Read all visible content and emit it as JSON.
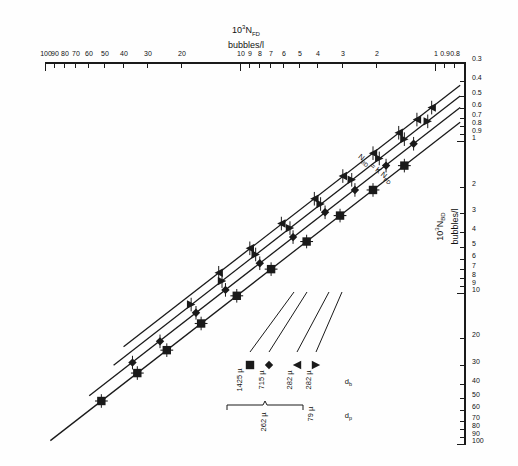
{
  "chart_data": {
    "type": "scatter",
    "title": "",
    "orientation_note": "printed upside-down (rotated 180 degrees)",
    "xlabel": "10³ N_FD  bubbles/l",
    "xlabel_parts": {
      "prefix": "10",
      "exp": "3",
      "sym": "N",
      "sub": "FD",
      "units": "bubbles/l"
    },
    "ylabel": "10³ N_BD  bubbles/l",
    "ylabel_parts": {
      "prefix": "10",
      "exp": "3",
      "sym": "N",
      "sub": "BD",
      "units": "bubbles/l"
    },
    "xscale": "log",
    "yscale": "log",
    "xlim": [
      0.7,
      100
    ],
    "ylim": [
      0.3,
      100
    ],
    "grid": false,
    "xticks": [
      0.8,
      0.9,
      1,
      2,
      3,
      4,
      5,
      6,
      7,
      8,
      9,
      10,
      20,
      30,
      40,
      50,
      60,
      70,
      80,
      90,
      100
    ],
    "xticklabels": [
      "0.8",
      "0.9",
      "1",
      "2",
      "3",
      "4",
      "5",
      "6",
      "7",
      "8",
      "9",
      "10",
      "20",
      "30",
      "40",
      "50",
      "60",
      "70",
      "80",
      "90",
      "100"
    ],
    "yticks": [
      0.3,
      0.4,
      0.5,
      0.6,
      0.7,
      0.8,
      0.9,
      1,
      2,
      3,
      4,
      5,
      6,
      7,
      8,
      9,
      10,
      20,
      30,
      40,
      50,
      60,
      70,
      80,
      90,
      100
    ],
    "yticklabels": [
      "0.3",
      "0.4",
      "0.5",
      "0.6",
      "0.7",
      "0.8",
      "0.9",
      "1",
      "2",
      "3",
      "4",
      "5",
      "6",
      "7",
      "8",
      "9",
      "10",
      "20",
      "30",
      "40",
      "50",
      "60",
      "70",
      "80",
      "90",
      "100"
    ],
    "annotation": "N_BD = K N_FD",
    "annotation_parts": {
      "lhs_sym": "N",
      "lhs_sub": "BD",
      "eq": "=",
      "k": "K",
      "rhs_sym": "N",
      "rhs_sub": "FD"
    },
    "fit_lines": [
      {
        "name": "line-1425u",
        "marker": "square-cross",
        "K": 1.0,
        "x0": 0.75,
        "x1": 95
      },
      {
        "name": "line-715u",
        "marker": "diamond",
        "K": 0.8,
        "x0": 0.75,
        "x1": 60
      },
      {
        "name": "line-282u-b",
        "marker": "triangle-left",
        "K": 0.67,
        "x0": 0.75,
        "x1": 45
      },
      {
        "name": "line-282u-a",
        "marker": "triangle-right",
        "K": 0.57,
        "x0": 0.75,
        "x1": 40
      }
    ],
    "series": [
      {
        "name": "dp 79 µ / db 282 µ",
        "marker": "triangle-right",
        "dp": "79 µ",
        "db": "282 µ",
        "points": [
          {
            "x": 1.05,
            "y": 0.6
          },
          {
            "x": 1.25,
            "y": 0.72
          },
          {
            "x": 1.55,
            "y": 0.88
          },
          {
            "x": 2.1,
            "y": 1.2
          },
          {
            "x": 3.0,
            "y": 1.7
          },
          {
            "x": 4.2,
            "y": 2.4
          },
          {
            "x": 6.2,
            "y": 3.5
          },
          {
            "x": 9.0,
            "y": 5.1
          },
          {
            "x": 13.0,
            "y": 7.4
          }
        ]
      },
      {
        "name": "dp 262 µ / db 282 µ",
        "marker": "triangle-left",
        "dp": "262 µ",
        "db": "282 µ",
        "points": [
          {
            "x": 1.1,
            "y": 0.74
          },
          {
            "x": 1.45,
            "y": 0.97
          },
          {
            "x": 1.95,
            "y": 1.3
          },
          {
            "x": 2.7,
            "y": 1.8
          },
          {
            "x": 3.9,
            "y": 2.6
          },
          {
            "x": 5.6,
            "y": 3.75
          },
          {
            "x": 8.4,
            "y": 5.6
          },
          {
            "x": 12.5,
            "y": 8.4
          },
          {
            "x": 18.0,
            "y": 12.0
          }
        ]
      },
      {
        "name": "dp 262 µ / db 715 µ",
        "marker": "diamond",
        "dp": "262 µ",
        "db": "715 µ",
        "points": [
          {
            "x": 1.3,
            "y": 1.04
          },
          {
            "x": 1.8,
            "y": 1.45
          },
          {
            "x": 2.6,
            "y": 2.1
          },
          {
            "x": 3.7,
            "y": 2.95
          },
          {
            "x": 5.4,
            "y": 4.3
          },
          {
            "x": 8.0,
            "y": 6.4
          },
          {
            "x": 12.0,
            "y": 9.6
          },
          {
            "x": 17.0,
            "y": 13.6
          },
          {
            "x": 26.0,
            "y": 21.0
          },
          {
            "x": 36.0,
            "y": 29.0
          }
        ]
      },
      {
        "name": "dp 262 µ / db 1425 µ",
        "marker": "square-cross",
        "dp": "262 µ",
        "db": "1425 µ",
        "points": [
          {
            "x": 1.45,
            "y": 1.45
          },
          {
            "x": 2.1,
            "y": 2.1
          },
          {
            "x": 3.1,
            "y": 3.1
          },
          {
            "x": 4.6,
            "y": 4.6
          },
          {
            "x": 7.0,
            "y": 7.0
          },
          {
            "x": 10.5,
            "y": 10.5
          },
          {
            "x": 16.0,
            "y": 16.0
          },
          {
            "x": 24.0,
            "y": 24.0
          },
          {
            "x": 34.0,
            "y": 34.0
          },
          {
            "x": 52.0,
            "y": 52.0
          }
        ]
      }
    ],
    "legend": {
      "position": "upper-right-area",
      "col_headers": [
        "dₚ",
        "dᵦ"
      ],
      "header_dp": "d",
      "header_dp_sub": "p",
      "header_db": "d",
      "header_db_sub": "b",
      "brace_label": "262 µ",
      "rows": [
        {
          "dp": "79 µ",
          "db": "282 µ",
          "marker": "triangle-right"
        },
        {
          "dp": "262 µ",
          "db": "282 µ",
          "marker": "triangle-left"
        },
        {
          "dp": "262 µ",
          "db": "715 µ",
          "marker": "diamond"
        },
        {
          "dp": "262 µ",
          "db": "1425 µ",
          "marker": "square-cross"
        }
      ]
    },
    "colors": {
      "ink": "#1a1a1a",
      "paper": "#fefefe"
    }
  }
}
